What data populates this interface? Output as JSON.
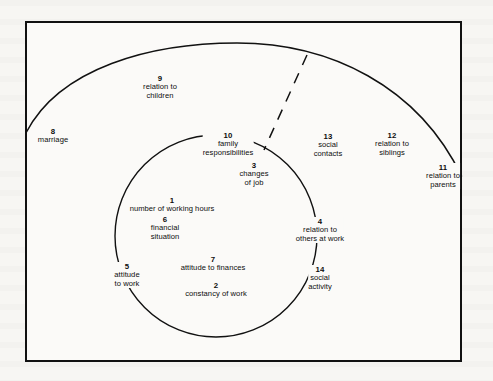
{
  "figure": {
    "type": "concentric-circle-diagram",
    "line_color": "#111111",
    "background_color": "#fbfaf8",
    "frame": {
      "stroke": "#111111",
      "stroke_width": 2.5
    }
  },
  "rings": {
    "outer_arc": {
      "name": "outer-arc",
      "style": "solid",
      "description": "large arc spanning from the left frame edge to the right frame edge"
    },
    "inner_circle": {
      "name": "inner-circle",
      "style": "solid",
      "description": "full circle in the centre"
    },
    "divider": {
      "name": "dashed-divider",
      "style": "dashed",
      "description": "dashed radial line from the outer arc down to the inner circle"
    }
  },
  "labels": [
    {
      "id": "l1",
      "number": "1",
      "lines": [
        "number of working hours"
      ]
    },
    {
      "id": "l2",
      "number": "2",
      "lines": [
        "constancy  of  work"
      ]
    },
    {
      "id": "l3",
      "number": "3",
      "lines": [
        "changes",
        "of  job"
      ]
    },
    {
      "id": "l4",
      "number": "4",
      "lines": [
        "relation to",
        "others  at work"
      ]
    },
    {
      "id": "l5",
      "number": "5",
      "lines": [
        "attitude",
        "to  work"
      ]
    },
    {
      "id": "l6",
      "number": "6",
      "lines": [
        "financial",
        "situation"
      ]
    },
    {
      "id": "l7",
      "number": "7",
      "lines": [
        "attitude to finances"
      ]
    },
    {
      "id": "l8",
      "number": "8",
      "lines": [
        "marriage"
      ]
    },
    {
      "id": "l9",
      "number": "9",
      "lines": [
        "relation to",
        "children"
      ]
    },
    {
      "id": "l10",
      "number": "10",
      "lines": [
        "family",
        "responsibilities"
      ]
    },
    {
      "id": "l11",
      "number": "11",
      "lines": [
        "relation to",
        "parents"
      ]
    },
    {
      "id": "l12",
      "number": "12",
      "lines": [
        "relation to",
        "siblings"
      ]
    },
    {
      "id": "l13",
      "number": "13",
      "lines": [
        "social",
        "contacts"
      ]
    },
    {
      "id": "l14",
      "number": "14",
      "lines": [
        "social",
        "activity"
      ]
    }
  ]
}
